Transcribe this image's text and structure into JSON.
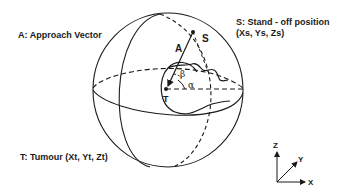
{
  "labels": {
    "approach_vector": "A: Approach Vector",
    "standoff_line1": "S: Stand - off position",
    "standoff_line2": "(Xs, Ys, Zs)",
    "tumour": "T: Tumour (Xt, Yt, Zt)"
  },
  "points": {
    "S": "S",
    "A": "A",
    "T": "T",
    "beta": "β",
    "alpha": "α"
  },
  "axes": {
    "z": "Z",
    "y": "Y",
    "x": "X"
  },
  "colors": {
    "line": "#1a1a1a",
    "background": "#ffffff"
  }
}
